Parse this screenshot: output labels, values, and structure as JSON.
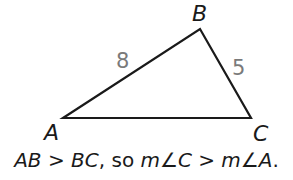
{
  "diagram": {
    "vertices": [
      {
        "name": "A",
        "x": 63,
        "y": 118
      },
      {
        "name": "B",
        "x": 200,
        "y": 29
      },
      {
        "name": "C",
        "x": 251,
        "y": 118
      }
    ],
    "side_labels": {
      "AB": "8",
      "BC": "5"
    },
    "stroke_color": "#1a1a1a",
    "side_label_color": "#7a7a7a"
  },
  "labels": {
    "A": "A",
    "B": "B",
    "C": "C",
    "AB": "8",
    "BC": "5"
  },
  "caption": {
    "part1": "AB > BC",
    "part2": ", so ",
    "part3": "m∠C > m∠A",
    "part4": "."
  }
}
